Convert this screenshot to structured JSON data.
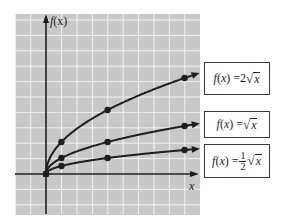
{
  "chart_data": {
    "type": "line",
    "title": "",
    "xlabel": "x",
    "ylabel": "f(x)",
    "xlim": [
      -2,
      10
    ],
    "ylim": [
      -2.5,
      10
    ],
    "grid": true,
    "legend_position": "right (boxed labels beside curve ends)",
    "series": [
      {
        "name": "f(x) = 2√x",
        "points": [
          [
            0,
            0
          ],
          [
            1,
            2
          ],
          [
            4,
            4
          ],
          [
            9,
            6
          ]
        ]
      },
      {
        "name": "f(x) = √x",
        "points": [
          [
            0,
            0
          ],
          [
            1,
            1
          ],
          [
            4,
            2
          ],
          [
            9,
            3
          ]
        ]
      },
      {
        "name": "f(x) = ½√x",
        "points": [
          [
            0,
            0
          ],
          [
            1,
            0.5
          ],
          [
            4,
            1
          ],
          [
            9,
            1.5
          ]
        ]
      }
    ]
  },
  "axes": {
    "y_label_func": "f",
    "y_label_arg": "(x)",
    "x_label": "x"
  },
  "labels": [
    {
      "prefix": "f(x) = ",
      "coef": "2",
      "arg": "x"
    },
    {
      "prefix": "f(x) = ",
      "coef": "",
      "arg": "x"
    },
    {
      "prefix": "f(x) = ",
      "num": "1",
      "den": "2",
      "arg": "x"
    }
  ],
  "colors": {
    "grid_bg": "#c8c8c8",
    "grid_line": "#f2f2f2",
    "axis": "#1a1a1a",
    "curve": "#1e1e1e"
  }
}
